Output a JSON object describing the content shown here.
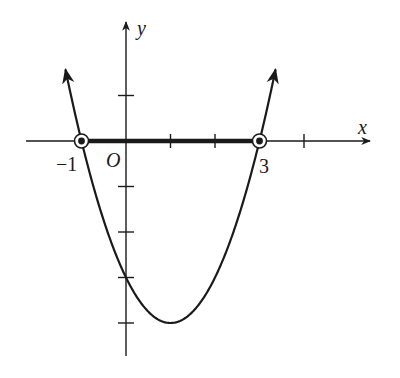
{
  "figure": {
    "axes": {
      "x_label": "x",
      "y_label": "y",
      "origin_label": "O"
    },
    "tick_labels": {
      "left_root": "−1",
      "right_root": "3"
    },
    "x_ticks": [
      -1,
      1,
      2,
      3,
      4
    ],
    "y_ticks": [
      1,
      -1,
      -2,
      -3,
      -4
    ],
    "curve": {
      "type": "parabola",
      "roots": [
        -1,
        3
      ],
      "vertex": [
        1,
        -4
      ],
      "arrows_on_ends": true
    },
    "highlighted_interval": {
      "from": -1,
      "to": 3,
      "style": "bold segment on x-axis"
    },
    "marked_points": [
      {
        "x": -1,
        "y": 0,
        "style": "circled dot"
      },
      {
        "x": 3,
        "y": 0,
        "style": "circled dot"
      }
    ],
    "colors": {
      "ink": "#1a1a1a",
      "background": "#ffffff"
    }
  }
}
